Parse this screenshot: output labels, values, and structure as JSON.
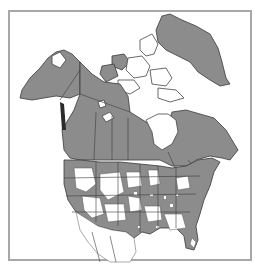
{
  "map": {
    "type": "species range distribution map",
    "region": "North America",
    "legend": [],
    "colors": {
      "range_present": "#8c8c8c",
      "range_absent": "#ffffff",
      "outline": "#3a3a3a",
      "frame": "#a8a8a8",
      "background": "#ffffff"
    },
    "areas": [
      {
        "name": "Greenland",
        "status": "present"
      },
      {
        "name": "Alaska",
        "status": "present"
      },
      {
        "name": "Canadian Arctic Archipelago",
        "status": "mostly absent"
      },
      {
        "name": "Hudson Bay",
        "status": "water"
      },
      {
        "name": "Western & Central Canada",
        "status": "present"
      },
      {
        "name": "Eastern Canada / Labrador",
        "status": "present"
      },
      {
        "name": "Contiguous United States",
        "status": "patchy"
      },
      {
        "name": "Mexico",
        "status": "absent"
      }
    ]
  }
}
